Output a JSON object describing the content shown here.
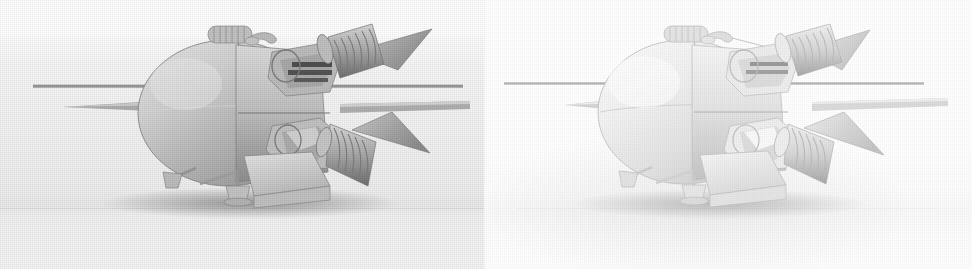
{
  "figure": {
    "caption": "",
    "panel_count": 2,
    "image_type": "grayscale 3d render pair",
    "background_color": "#ffffff"
  },
  "panels": [
    {
      "id": "panel-left",
      "label": "",
      "backdrop_color": "#f1f1f1",
      "backdrop_note": "light grey rendered ground plane filling panel",
      "subject": "spacecraft-render",
      "shading": "matte grey, dithered, directional light from upper left",
      "x": 0,
      "y": 0,
      "width": 486,
      "height": 269
    },
    {
      "id": "panel-right",
      "label": "",
      "backdrop_color": "#ffffff",
      "backdrop_note": "white background with soft contact shadow only",
      "subject": "spacecraft-render",
      "shading": "high key, pale grey, soft ambient occlusion",
      "x": 486,
      "y": 0,
      "width": 486,
      "height": 269
    }
  ],
  "subject": {
    "name": "Soviet lunar/planetary probe descent stage",
    "body": "ovoid pressurised main tank",
    "parts": [
      "main-ovoid-body",
      "upper-ribbed-tank",
      "top-handle-bracket",
      "rivet-seam-band",
      "upper-engine-nozzle",
      "lower-engine-nozzle",
      "upper-thruster-cluster",
      "lower-thruster-cluster",
      "triangular-antenna-vane-upper",
      "triangular-antenna-vane-lower",
      "long-horizontal-antenna-rod",
      "tapered-nose-spike",
      "flat-rectangular-panel",
      "landing-leg-left",
      "landing-pad-left",
      "landing-leg-center",
      "landing-pad-center",
      "ground-shadow"
    ]
  },
  "palette": {
    "white": "#ffffff",
    "backdrop_grey": "#f1f1f1",
    "horizon_grey": "#e8e8e8",
    "body_light": "#d8d8d8",
    "body_mid": "#b6b6b6",
    "body_dark": "#8e8e8e",
    "shadow_dark": "#5a5a5a",
    "outline": "#6f6f6f",
    "highlight": "#efefef",
    "right_body_light": "#f4f4f4",
    "right_body_mid": "#e2e2e2",
    "right_body_dark": "#c4c4c4"
  }
}
